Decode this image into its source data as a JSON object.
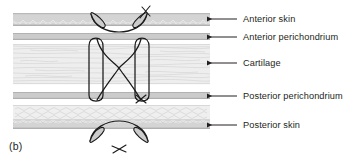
{
  "figure": {
    "caption": "(b)"
  },
  "labels": [
    {
      "id": "anterior-skin",
      "text": "Anterior skin",
      "x": 243,
      "y": 14,
      "leader": {
        "x1": 237,
        "y1": 19,
        "x2": 206,
        "y2": 19
      }
    },
    {
      "id": "anterior-perichondrium",
      "text": "Anterior perichondrium",
      "x": 243,
      "y": 32,
      "leader": {
        "x1": 237,
        "y1": 37,
        "x2": 206,
        "y2": 37
      }
    },
    {
      "id": "cartilage",
      "text": "Cartilage",
      "x": 243,
      "y": 58,
      "leader": {
        "x1": 237,
        "y1": 63,
        "x2": 206,
        "y2": 63
      }
    },
    {
      "id": "posterior-perichondrium",
      "text": "Posterior perichondrium",
      "x": 243,
      "y": 91,
      "leader": {
        "x1": 237,
        "y1": 96,
        "x2": 206,
        "y2": 96
      }
    },
    {
      "id": "posterior-skin",
      "text": "Posterior skin",
      "x": 243,
      "y": 120,
      "leader": {
        "x1": 237,
        "y1": 125,
        "x2": 206,
        "y2": 125
      }
    }
  ],
  "layers": [
    {
      "id": "anterior-skin-band",
      "name": "Anterior skin",
      "y": 13,
      "height": 13,
      "fill": "#d2d2d2"
    },
    {
      "id": "anterior-perichondrium-band",
      "name": "Anterior perichondrium",
      "y": 33,
      "height": 7,
      "fill": "#c9c9c9"
    },
    {
      "id": "cartilage-band",
      "name": "Cartilage",
      "y": 44,
      "height": 40,
      "fill": "#ededed"
    },
    {
      "id": "posterior-perichondrium-band",
      "name": "Posterior perichondrium",
      "y": 92,
      "height": 7,
      "fill": "#c9c9c9"
    },
    {
      "id": "posterior-skin-band",
      "name": "Posterior skin",
      "y": 105,
      "height": 24,
      "fill": "#eeeeee"
    }
  ],
  "colors": {
    "ink": "#231f20",
    "skin_grey": "#d2d2d2",
    "perichondrium_grey": "#c9c9c9",
    "cartilage_light": "#ededed",
    "leader_line": "#231f20",
    "suture_line": "#1a1a1a",
    "needle_fill": "#cfcfcf"
  },
  "annotations": {
    "needle_top_mark": "X",
    "needle_bottom_mark": "X",
    "suture_pattern": "figure-of-eight"
  }
}
